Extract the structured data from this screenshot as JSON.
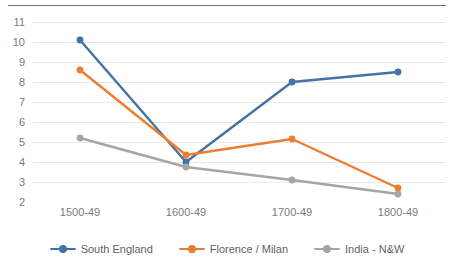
{
  "chart_data": {
    "type": "line",
    "title": "",
    "subtitle": "",
    "xlabel": "",
    "ylabel": "",
    "categories": [
      "1500-49",
      "1600-49",
      "1700-49",
      "1800-49"
    ],
    "ylim": [
      2,
      11
    ],
    "yticks": [
      2,
      3,
      4,
      5,
      6,
      7,
      8,
      9,
      10,
      11
    ],
    "ytick_labels": [
      "2",
      "3",
      "4",
      "5",
      "6",
      "7",
      "8",
      "9",
      "10",
      "11"
    ],
    "grid": true,
    "grid_axis": "y",
    "legend_position": "bottom",
    "markers": "circle",
    "series": [
      {
        "name": "South England",
        "color": "#4472A4",
        "values": [
          10.1,
          4.0,
          8.0,
          8.5
        ]
      },
      {
        "name": "Florence / Milan",
        "color": "#ED7D31",
        "values": [
          8.6,
          4.35,
          5.15,
          2.7
        ]
      },
      {
        "name": "India - N&W",
        "color": "#A5A5A5",
        "values": [
          5.2,
          3.75,
          3.1,
          2.4
        ]
      }
    ]
  },
  "decor": {
    "top_rule_color": "#6e6e6e",
    "grid_color": "#e8e8e8",
    "axis_text_color": "#7a7a7a",
    "background": "#ffffff"
  }
}
